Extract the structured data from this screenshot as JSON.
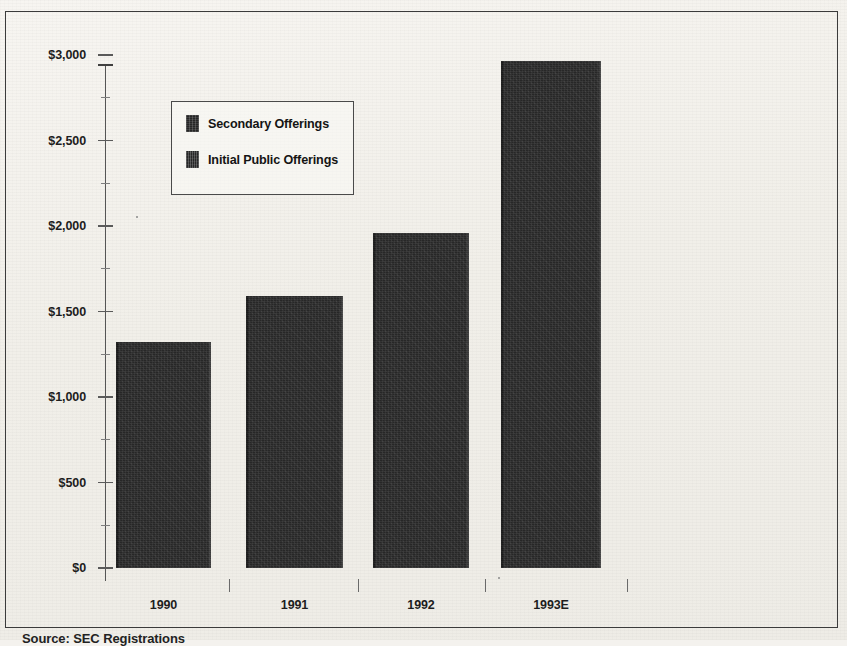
{
  "figure": {
    "caption": "Source:  SEC Registrations"
  },
  "legend": {
    "items": [
      {
        "label": "Secondary Offerings",
        "swatch": "secondary-offerings-swatch"
      },
      {
        "label": "Initial Public Offerings",
        "swatch": "initial-public-offerings-swatch"
      }
    ]
  },
  "chart_data": {
    "type": "bar",
    "title": "",
    "xlabel": "",
    "ylabel": "",
    "categories": [
      "1990",
      "1991",
      "1992",
      "1993E"
    ],
    "values": [
      1320,
      1590,
      1960,
      2965
    ],
    "ylim": [
      0,
      3000
    ],
    "ytick_values": [
      0,
      500,
      1000,
      1500,
      2000,
      2500,
      3000
    ],
    "ytick_labels": [
      "$0",
      "$500",
      "$1,000",
      "$1,500",
      "$2,000",
      "$2,500",
      "$3,000"
    ],
    "minor_ytick_values": [
      250,
      750,
      1250,
      1750,
      2250,
      2750
    ],
    "grid": false,
    "legend_position": "upper-left-inside",
    "series": [
      {
        "name": "Secondary Offerings",
        "values": [
          1320,
          1590,
          1960,
          2965
        ]
      },
      {
        "name": "Initial Public Offerings",
        "values": [
          1320,
          1590,
          1960,
          2965
        ]
      }
    ],
    "bar_color": "#272727"
  }
}
